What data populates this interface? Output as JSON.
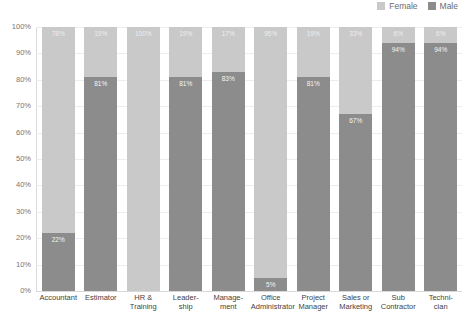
{
  "legend": {
    "position": "top-right",
    "items": [
      {
        "label": "Female",
        "color": "#c9c9c9",
        "icon": "legend-swatch-female"
      },
      {
        "label": "Male",
        "color": "#8c8c8c",
        "icon": "legend-swatch-male"
      }
    ]
  },
  "axis": {
    "yticks": [
      "100%",
      "90%",
      "80%",
      "70%",
      "60%",
      "50%",
      "40%",
      "30%",
      "20%",
      "10%",
      "0%"
    ]
  },
  "chart_data": {
    "type": "bar",
    "subtype": "stacked-percentage",
    "title": "",
    "xlabel": "",
    "ylabel": "",
    "ylim": [
      0,
      100
    ],
    "ytick_values": [
      0,
      10,
      20,
      30,
      40,
      50,
      60,
      70,
      80,
      90,
      100
    ],
    "grid": true,
    "legend_position": "top-right",
    "categories": [
      "Accountant",
      "Estimator",
      "HR &\nTraining",
      "Leader-\nship",
      "Manage-\nment",
      "Office\nAdministrator",
      "Project\nManager",
      "Sales or\nMarketing",
      "Sub\nContractor",
      "Techni-\ncian"
    ],
    "series": [
      {
        "name": "Female",
        "color": "#c9c9c9",
        "values": [
          78,
          19,
          100,
          19,
          17,
          95,
          19,
          33,
          6,
          6
        ],
        "labels": [
          "78%",
          "19%",
          "100%",
          "19%",
          "17%",
          "95%",
          "19%",
          "33%",
          "6%",
          "6%"
        ]
      },
      {
        "name": "Male",
        "color": "#8c8c8c",
        "values": [
          22,
          81,
          0,
          81,
          83,
          5,
          81,
          67,
          94,
          94
        ],
        "labels": [
          "22%",
          "81%",
          "",
          "81%",
          "83%",
          "5%",
          "81%",
          "67%",
          "94%",
          "94%"
        ]
      }
    ]
  }
}
